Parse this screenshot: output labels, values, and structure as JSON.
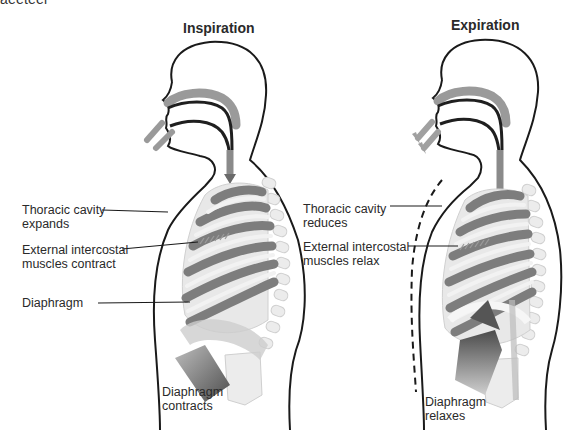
{
  "figure": {
    "cropped_top_text": "aeeteel",
    "panels": [
      {
        "id": "inspiration",
        "title": "Inspiration",
        "labels": [
          {
            "text": "Thoracic cavity\nexpands",
            "target": "chest-wall"
          },
          {
            "text": "External intercostal\nmuscles  contract",
            "target": "intercostal-muscles"
          },
          {
            "text": "Diaphragm",
            "target": "diaphragm"
          },
          {
            "text": "Diaphragm\ncontracts",
            "target": "diaphragm-arrow"
          }
        ],
        "airflow": "inward"
      },
      {
        "id": "expiration",
        "title": "Expiration",
        "labels": [
          {
            "text": "Thoracic cavity\nreduces",
            "target": "chest-wall"
          },
          {
            "text": "External intercostal\nmuscles  relax",
            "target": "intercostal-muscles"
          },
          {
            "text": "Diaphragm\nrelaxes",
            "target": "diaphragm-arrow"
          }
        ],
        "airflow": "outward"
      }
    ],
    "colors": {
      "outline": "#1a1a1a",
      "airway": "#7a7a7a",
      "airway_light": "#a8a8a8",
      "rib_dark": "#7d7d7d",
      "rib_light": "#e2e2e2",
      "bone": "#ececec",
      "arrow_dark": "#5a5a5a"
    }
  }
}
